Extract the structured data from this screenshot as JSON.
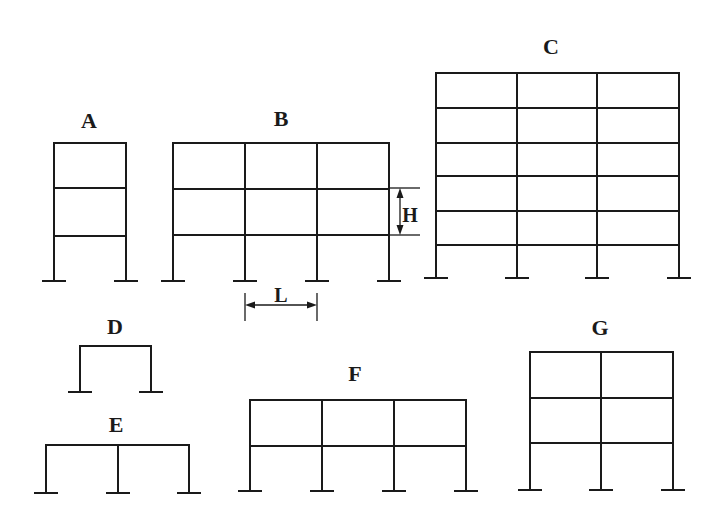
{
  "diagram": {
    "type": "structural-frames",
    "line_color": "#1a1a1a",
    "background": "#ffffff",
    "frames": [
      {
        "id": "A",
        "label": "A",
        "label_pos": [
          89,
          128
        ],
        "columns_x": [
          54,
          126
        ],
        "levels_y": [
          143,
          188,
          236
        ],
        "base_y": 281,
        "bays": 1,
        "stories": 3
      },
      {
        "id": "B",
        "label": "B",
        "label_pos": [
          281,
          126
        ],
        "columns_x": [
          173,
          245,
          317,
          389
        ],
        "levels_y": [
          143,
          189,
          235
        ],
        "base_y": 281,
        "bays": 3,
        "stories": 3
      },
      {
        "id": "C",
        "label": "C",
        "label_pos": [
          551,
          54
        ],
        "columns_x": [
          436,
          517,
          597,
          679
        ],
        "levels_y": [
          73,
          108,
          143,
          176,
          211,
          245
        ],
        "base_y": 278,
        "bays": 3,
        "stories": 6
      },
      {
        "id": "D",
        "label": "D",
        "label_pos": [
          115,
          334
        ],
        "columns_x": [
          80,
          151
        ],
        "levels_y": [
          346
        ],
        "base_y": 392,
        "bays": 1,
        "stories": 1
      },
      {
        "id": "E",
        "label": "E",
        "label_pos": [
          116,
          432
        ],
        "columns_x": [
          46,
          118,
          189
        ],
        "levels_y": [
          445
        ],
        "base_y": 493,
        "bays": 2,
        "stories": 1
      },
      {
        "id": "F",
        "label": "F",
        "label_pos": [
          355,
          381
        ],
        "columns_x": [
          250,
          322,
          394,
          466
        ],
        "levels_y": [
          400,
          446
        ],
        "base_y": 491,
        "bays": 3,
        "stories": 2
      },
      {
        "id": "G",
        "label": "G",
        "label_pos": [
          600,
          335
        ],
        "columns_x": [
          530,
          601,
          673
        ],
        "levels_y": [
          352,
          398,
          443
        ],
        "base_y": 490,
        "bays": 2,
        "stories": 3
      }
    ],
    "dimensions": [
      {
        "id": "H",
        "label": "H",
        "meaning": "story height",
        "orientation": "vertical",
        "x": 400,
        "y1": 188,
        "y2": 235,
        "tick_x1": 390,
        "tick_x2": 420,
        "label_pos": [
          410,
          222
        ]
      },
      {
        "id": "L",
        "label": "L",
        "meaning": "bay width",
        "orientation": "horizontal",
        "y": 305,
        "x1": 245,
        "x2": 317,
        "tick_y1": 293,
        "tick_y2": 321,
        "label_pos": [
          281,
          302
        ]
      }
    ]
  }
}
